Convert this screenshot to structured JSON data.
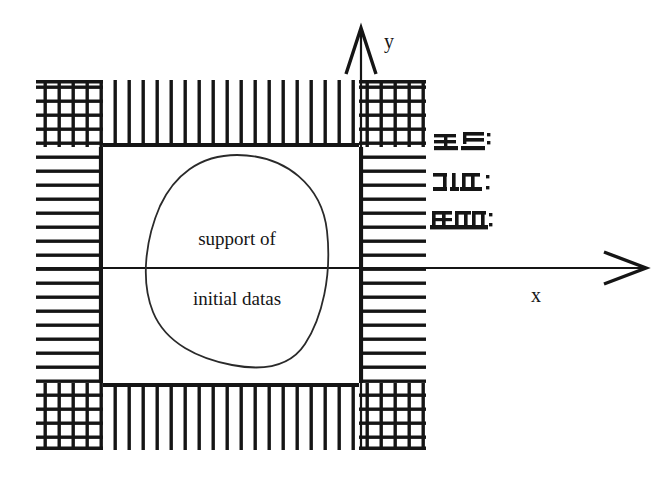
{
  "figure": {
    "kind": "mathematical-diagram",
    "background_color": "#ffffff",
    "ink_color": "#151515",
    "curve_color": "#2a2a2a"
  },
  "axes": {
    "x_axis": {
      "label": "x",
      "label_x": 536,
      "label_y": 302,
      "line_y": 268,
      "line_x_start": 36,
      "line_x_end": 648,
      "arrow": "right-arrow-head"
    },
    "y_axis": {
      "label": "y",
      "label_x": 389,
      "label_y": 48,
      "line_x": 361,
      "line_y_start": 450,
      "line_y_end": 28,
      "arrow": "up-arrow-head"
    },
    "origin": {
      "x": 361,
      "y": 268
    }
  },
  "support_region": {
    "name": "support of initial datas",
    "lines": [
      {
        "text": "support of",
        "x": 237,
        "y": 245
      },
      {
        "text": "initial datas",
        "x": 237,
        "y": 305
      }
    ],
    "outline": {
      "center_x": 237,
      "center_y": 262,
      "radius_x": 90,
      "radius_y": 107
    }
  },
  "domain_box": {
    "outer": {
      "x": 36,
      "y": 80,
      "width": 390,
      "height": 370
    },
    "inner": {
      "x": 103,
      "y": 147,
      "width": 256,
      "height": 236
    },
    "band_thickness": 67,
    "corner_style": "cross-hatch-grid",
    "top_bottom_style": "vertical-hatch",
    "left_right_style": "horizontal-hatch",
    "hatch_pitch": 14,
    "hatch_stroke_width": 3.4,
    "rail_stroke_width": 4.6
  },
  "annotations": {
    "title": "degraded marginal glyphs",
    "items": [
      {
        "id": "glyph-block-1",
        "text": "≡≠",
        "x": 435,
        "y": 148,
        "note": "illegible scan artifact"
      },
      {
        "id": "glyph-block-2",
        "text": "⊃I.π:",
        "x": 435,
        "y": 192,
        "note": "illegible scan artifact"
      },
      {
        "id": "glyph-block-3",
        "text": "ЩπЄ",
        "x": 435,
        "y": 227,
        "note": "illegible scan artifact"
      }
    ]
  }
}
